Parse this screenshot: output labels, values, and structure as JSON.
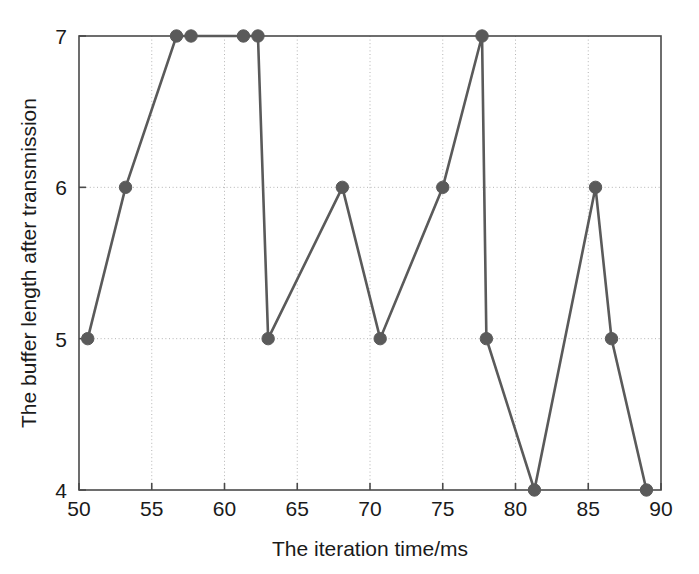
{
  "chart_data": {
    "type": "line",
    "title": "",
    "xlabel": "The iteration time/ms",
    "ylabel": "The buffer length after transmission",
    "xlim": [
      50,
      90
    ],
    "ylim": [
      4,
      7
    ],
    "xticks": [
      50,
      55,
      60,
      65,
      70,
      75,
      80,
      85,
      90
    ],
    "xtick_labels": [
      "50",
      "55",
      "60",
      "65",
      "70",
      "75",
      "80",
      "85",
      "90"
    ],
    "yticks": [
      4,
      5,
      6,
      7
    ],
    "ytick_labels": [
      "4",
      "5",
      "6",
      "7"
    ],
    "grid": true,
    "grid_style": "dotted",
    "legend": false,
    "line_color": "#5a5a5a",
    "marker_color": "#5a5a5a",
    "marker": "circle",
    "background_color": "#ffffff",
    "axis_color": "#4a4a4a",
    "series": [
      {
        "name": "buffer length",
        "x": [
          50.6,
          53.2,
          56.7,
          57.7,
          61.3,
          62.3,
          63.0,
          68.1,
          70.7,
          75.0,
          77.7,
          78.0,
          81.3,
          85.5,
          86.6,
          89.0
        ],
        "values": [
          5,
          6,
          7,
          7,
          7,
          7,
          5,
          6,
          5,
          6,
          7,
          5,
          4,
          6,
          5,
          4
        ]
      }
    ]
  }
}
